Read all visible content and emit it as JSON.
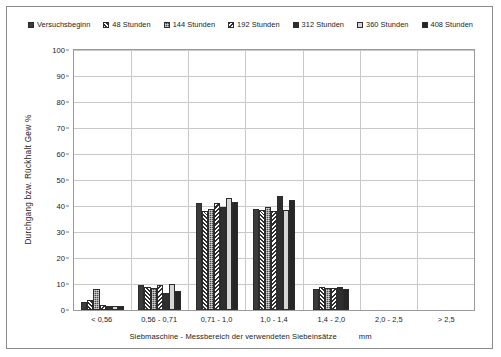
{
  "chart_data": {
    "type": "bar",
    "title": "",
    "xlabel": "Siebmaschine  -  Messbereich der verwendeten Siebeinsätze",
    "xunit": "mm",
    "ylabel": "Durchgang  bzw.  Rückhalt    Gew %",
    "ylim": [
      0,
      100
    ],
    "yticks": [
      0,
      10,
      20,
      30,
      40,
      50,
      60,
      70,
      80,
      90,
      100
    ],
    "grid": true,
    "legend_position": "top",
    "categories": [
      "< 0,56",
      "0,56 - 0,71",
      "0,71 - 1,0",
      "1,0 - 1,4",
      "1,4 - 2,0",
      "2,0 - 2,5",
      "> 2,5"
    ],
    "series": [
      {
        "name": "Versuchsbeginn",
        "pattern": "p-solid-dark",
        "values": [
          3.0,
          9.5,
          41.0,
          39.0,
          8.0,
          0,
          0
        ]
      },
      {
        "name": "48 Stunden",
        "pattern": "p-diag",
        "values": [
          4.0,
          9.0,
          38.0,
          38.5,
          9.0,
          0,
          0
        ]
      },
      {
        "name": "144 Stunden",
        "pattern": "p-dotted",
        "values": [
          8.0,
          8.5,
          39.0,
          39.5,
          8.5,
          0,
          0
        ]
      },
      {
        "name": "192 Stunden",
        "pattern": "p-chevron",
        "values": [
          2.0,
          9.5,
          41.0,
          38.0,
          8.5,
          0,
          0
        ]
      },
      {
        "name": "312 Stunden",
        "pattern": "p-solid-dark2",
        "values": [
          1.5,
          6.5,
          39.5,
          44.0,
          9.0,
          0,
          0
        ]
      },
      {
        "name": "360 Stunden",
        "pattern": "p-light",
        "values": [
          1.5,
          10.0,
          43.0,
          38.5,
          0,
          0,
          0
        ]
      },
      {
        "name": "408 Stunden",
        "pattern": "p-solid-black",
        "values": [
          1.5,
          7.5,
          41.5,
          42.5,
          8.0,
          0,
          0
        ]
      }
    ]
  }
}
